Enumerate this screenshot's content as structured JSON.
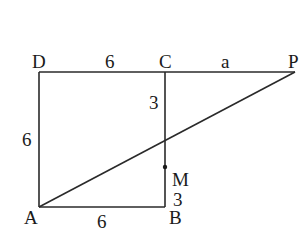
{
  "diagram": {
    "type": "geometry",
    "points": {
      "A": {
        "label": "A",
        "x": 39,
        "y": 207
      },
      "B": {
        "label": "B",
        "x": 165,
        "y": 207
      },
      "C": {
        "label": "C",
        "x": 165,
        "y": 72
      },
      "D": {
        "label": "D",
        "x": 39,
        "y": 72
      },
      "M": {
        "label": "M",
        "x": 165,
        "y": 167
      },
      "P": {
        "label": "P",
        "x": 295,
        "y": 72
      }
    },
    "segment_labels": {
      "DC": "6",
      "CP": "a",
      "DA": "6",
      "AB": "6",
      "CM": "3",
      "MB": "3"
    },
    "colors": {
      "line": "#2a2a2a",
      "text": "#1a1a1a",
      "background": "#ffffff"
    }
  }
}
